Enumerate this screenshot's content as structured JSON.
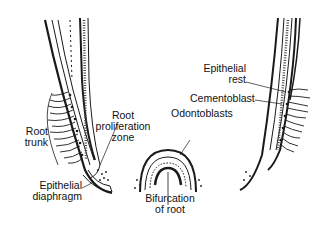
{
  "diagram": {
    "type": "anatomical illustration",
    "labels": {
      "root_trunk": [
        "Root",
        "trunk"
      ],
      "root_proliferation_zone": [
        "Root",
        "proliferation",
        "zone"
      ],
      "epithelial_diaphragm": [
        "Epithelial",
        "diaphragm"
      ],
      "odontoblasts": [
        "Odontoblasts"
      ],
      "bifurcation_of_root": [
        "Bifurcation",
        "of root"
      ],
      "epithelial_rest": [
        "Epithelial",
        "rest"
      ],
      "cementoblast": [
        "Cementoblast"
      ]
    },
    "colors": {
      "ink": "#1a1a1a",
      "background": "#ffffff"
    }
  }
}
